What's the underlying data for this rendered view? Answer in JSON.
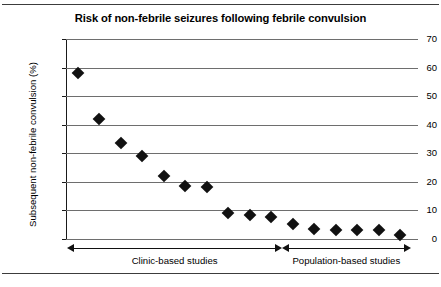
{
  "figure": {
    "top_rule": "",
    "bottom_rule": ""
  },
  "chart_data": {
    "type": "scatter",
    "title": "Risk of non-febrile seizures following febrile convulsion",
    "xlabel": "",
    "ylabel": "Subsequent non-febrile convulsion (%)",
    "ylim": [
      0,
      70
    ],
    "yticks": [
      0,
      10,
      20,
      30,
      40,
      50,
      60,
      70
    ],
    "ytick_labels": [
      "0",
      "10",
      "20",
      "30",
      "40",
      "50",
      "60",
      "70"
    ],
    "grid": "horizontal",
    "legend": "none",
    "marker_style": "filled-diamond",
    "marker_color": "#111111",
    "x": [
      1,
      2,
      3,
      4,
      5,
      6,
      7,
      8,
      9,
      10,
      11,
      12,
      13,
      14,
      15,
      16
    ],
    "values": [
      58,
      42,
      33.5,
      29,
      22,
      18.5,
      18.3,
      9,
      8.3,
      7.8,
      5.2,
      3.4,
      3.3,
      3.3,
      3.2,
      1.5
    ],
    "groups": [
      {
        "label": "Clinic-based studies",
        "point_indices": [
          0,
          1,
          2,
          3,
          4,
          5,
          6,
          7,
          8,
          9
        ],
        "arrow": "double-headed"
      },
      {
        "label": "Population-based studies",
        "point_indices": [
          10,
          11,
          12,
          13,
          14,
          15
        ],
        "arrow": "double-headed"
      }
    ]
  }
}
